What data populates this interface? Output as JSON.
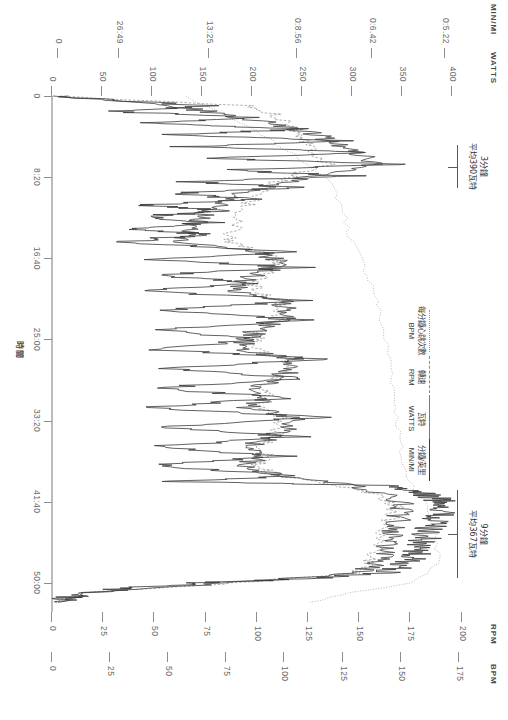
{
  "figure": {
    "title": "",
    "orientation": "rotated-90"
  },
  "axes": {
    "left_titles": [
      "MIN/MI",
      "WATTS"
    ],
    "right_titles": [
      "RPM",
      "BPM"
    ],
    "watts_ticks": [
      "400",
      "350",
      "300",
      "250",
      "200",
      "150",
      "100",
      "50",
      "0"
    ],
    "minmi_ticks": [
      "0:5.22",
      "0:6.42",
      "0:8.56",
      "13:25",
      "26:49",
      "0"
    ],
    "rpm_ticks": [
      "200",
      "175",
      "150",
      "125",
      "100",
      "75",
      "50",
      "25",
      "0"
    ],
    "bpm_ticks": [
      "175",
      "150",
      "125",
      "100",
      "75",
      "50",
      "25",
      "0"
    ],
    "time_ticks": [
      "0",
      "8:20",
      "16:40",
      "25:00",
      "33:20",
      "41:40",
      "50:00"
    ],
    "time_axis_label": "時間"
  },
  "legend": {
    "entries": [
      {
        "name": "bpm",
        "label_cjk": "每分鐘心跳次數",
        "label_unit": "BPM",
        "style": "dotted"
      },
      {
        "name": "rpm",
        "label_cjk": "轉速",
        "label_unit": "RPM",
        "style": "dashed"
      },
      {
        "name": "watts",
        "label_cjk": "瓦特",
        "label_unit": "WATTS",
        "style": "solid"
      },
      {
        "name": "minmi",
        "label_cjk": "分鐘/英里",
        "label_unit": "MIN/MI",
        "style": "solid-dark"
      }
    ]
  },
  "annotations": [
    {
      "name": "interval-3min",
      "line1": "3分鐘",
      "line2": "平均390瓦特"
    },
    {
      "name": "interval-9min",
      "line1": "9分鐘",
      "line2": "平均367瓦特"
    }
  ],
  "chart_data": {
    "type": "line",
    "title": "",
    "xlabel": "時間",
    "ylabel": "WATTS / MIN/MI / RPM / BPM",
    "x_ticks": [
      "0",
      "8:20",
      "16:40",
      "25:00",
      "33:20",
      "41:40",
      "50:00"
    ],
    "xlim": [
      0,
      53
    ],
    "axis_left_primary": {
      "name": "WATTS",
      "ticks": [
        400,
        350,
        300,
        250,
        200,
        150,
        100,
        50,
        0
      ],
      "ylim": [
        0,
        430
      ]
    },
    "axis_left_secondary": {
      "name": "MIN/MI",
      "ticks": [
        "0:5.22",
        "0:6.42",
        "0:8.56",
        "13:25",
        "26:49",
        "0"
      ]
    },
    "axis_right_primary": {
      "name": "RPM",
      "ticks": [
        200,
        175,
        150,
        125,
        100,
        75,
        50,
        25,
        0
      ],
      "ylim": [
        0,
        210
      ]
    },
    "axis_right_secondary": {
      "name": "BPM",
      "ticks": [
        175,
        150,
        125,
        100,
        75,
        50,
        25,
        0
      ],
      "ylim": [
        0,
        185
      ]
    },
    "grid": false,
    "legend_position": "center-right",
    "series": [
      {
        "name": "WATTS",
        "style": "solid",
        "color": "#3a3a3a",
        "points": [
          [
            0,
            5
          ],
          [
            1,
            150
          ],
          [
            1.6,
            60
          ],
          [
            2.2,
            210
          ],
          [
            2.8,
            90
          ],
          [
            3.4,
            260
          ],
          [
            4,
            110
          ],
          [
            4.6,
            300
          ],
          [
            5.2,
            130
          ],
          [
            5.8,
            330
          ],
          [
            6.4,
            150
          ],
          [
            7,
            350
          ],
          [
            7.6,
            170
          ],
          [
            8.2,
            300
          ],
          [
            8.8,
            140
          ],
          [
            9.4,
            250
          ],
          [
            10,
            120
          ],
          [
            10.6,
            200
          ],
          [
            11.2,
            95
          ],
          [
            11.8,
            175
          ],
          [
            12.4,
            85
          ],
          [
            13,
            160
          ],
          [
            13.6,
            80
          ],
          [
            14.2,
            150
          ],
          [
            15,
            70
          ],
          [
            16,
            240
          ],
          [
            16.8,
            95
          ],
          [
            17.6,
            250
          ],
          [
            18.4,
            100
          ],
          [
            19.2,
            200
          ],
          [
            20,
            90
          ],
          [
            21,
            260
          ],
          [
            22,
            110
          ],
          [
            23,
            255
          ],
          [
            24,
            105
          ],
          [
            25,
            215
          ],
          [
            26,
            95
          ],
          [
            27,
            270
          ],
          [
            28,
            120
          ],
          [
            29,
            250
          ],
          [
            30,
            100
          ],
          [
            31,
            235
          ],
          [
            32,
            95
          ],
          [
            33,
            265
          ],
          [
            34,
            115
          ],
          [
            35,
            245
          ],
          [
            36,
            100
          ],
          [
            37,
            230
          ],
          [
            38,
            95
          ],
          [
            39,
            250
          ],
          [
            39.6,
            120
          ],
          [
            40,
            330
          ],
          [
            40.6,
            360
          ],
          [
            41.2,
            380
          ],
          [
            41.8,
            395
          ],
          [
            42.6,
            390
          ],
          [
            43.4,
            385
          ],
          [
            44.2,
            380
          ],
          [
            45,
            375
          ],
          [
            45.8,
            370
          ],
          [
            46.6,
            365
          ],
          [
            47.4,
            360
          ],
          [
            48.2,
            350
          ],
          [
            49,
            330
          ],
          [
            49.6,
            250
          ],
          [
            50,
            150
          ],
          [
            50.6,
            70
          ],
          [
            51.4,
            20
          ],
          [
            52,
            5
          ]
        ]
      },
      {
        "name": "MIN/MI",
        "style": "solid-dark",
        "color": "#555555",
        "points": [
          [
            0,
            8
          ],
          [
            1,
            120
          ],
          [
            2,
            180
          ],
          [
            3,
            230
          ],
          [
            4,
            265
          ],
          [
            5,
            290
          ],
          [
            6,
            310
          ],
          [
            7,
            320
          ],
          [
            8,
            270
          ],
          [
            9,
            225
          ],
          [
            10,
            190
          ],
          [
            11,
            170
          ],
          [
            12,
            155
          ],
          [
            13,
            145
          ],
          [
            14,
            138
          ],
          [
            15,
            130
          ],
          [
            16,
            210
          ],
          [
            17,
            225
          ],
          [
            18,
            215
          ],
          [
            19,
            190
          ],
          [
            20,
            180
          ],
          [
            21,
            230
          ],
          [
            22,
            235
          ],
          [
            23,
            228
          ],
          [
            24,
            205
          ],
          [
            25,
            195
          ],
          [
            26,
            185
          ],
          [
            27,
            240
          ],
          [
            28,
            238
          ],
          [
            29,
            228
          ],
          [
            30,
            200
          ],
          [
            31,
            215
          ],
          [
            32,
            195
          ],
          [
            33,
            242
          ],
          [
            34,
            235
          ],
          [
            35,
            222
          ],
          [
            36,
            198
          ],
          [
            37,
            212
          ],
          [
            38,
            190
          ],
          [
            39,
            228
          ],
          [
            40,
            300
          ],
          [
            41,
            340
          ],
          [
            42,
            352
          ],
          [
            43,
            348
          ],
          [
            44,
            344
          ],
          [
            45,
            340
          ],
          [
            46,
            336
          ],
          [
            47,
            332
          ],
          [
            48,
            326
          ],
          [
            49,
            308
          ],
          [
            50,
            180
          ],
          [
            51,
            40
          ],
          [
            52,
            6
          ]
        ]
      },
      {
        "name": "RPM",
        "style": "dashed",
        "color": "#9a9a9a",
        "points": [
          [
            0,
            0
          ],
          [
            1,
            95
          ],
          [
            2,
            110
          ],
          [
            3,
            118
          ],
          [
            4,
            122
          ],
          [
            5,
            126
          ],
          [
            6,
            130
          ],
          [
            7,
            134
          ],
          [
            8,
            120
          ],
          [
            9,
            108
          ],
          [
            10,
            100
          ],
          [
            11,
            96
          ],
          [
            12,
            92
          ],
          [
            13,
            90
          ],
          [
            14,
            88
          ],
          [
            15,
            86
          ],
          [
            16,
            104
          ],
          [
            17,
            108
          ],
          [
            18,
            106
          ],
          [
            19,
            100
          ],
          [
            20,
            98
          ],
          [
            21,
            110
          ],
          [
            22,
            112
          ],
          [
            23,
            110
          ],
          [
            24,
            102
          ],
          [
            25,
            100
          ],
          [
            26,
            98
          ],
          [
            27,
            112
          ],
          [
            28,
            112
          ],
          [
            29,
            110
          ],
          [
            30,
            102
          ],
          [
            31,
            106
          ],
          [
            32,
            100
          ],
          [
            33,
            113
          ],
          [
            34,
            112
          ],
          [
            35,
            109
          ],
          [
            36,
            101
          ],
          [
            37,
            105
          ],
          [
            38,
            99
          ],
          [
            39,
            110
          ],
          [
            40,
            140
          ],
          [
            41,
            160
          ],
          [
            42,
            168
          ],
          [
            43,
            166
          ],
          [
            44,
            164
          ],
          [
            45,
            162
          ],
          [
            46,
            160
          ],
          [
            47,
            158
          ],
          [
            48,
            155
          ],
          [
            49,
            148
          ],
          [
            50,
            90
          ],
          [
            51,
            20
          ],
          [
            52,
            0
          ]
        ]
      },
      {
        "name": "BPM",
        "style": "dotted",
        "color": "#b0b0b0",
        "points": [
          [
            0,
            62
          ],
          [
            2,
            80
          ],
          [
            4,
            98
          ],
          [
            6,
            112
          ],
          [
            8,
            126
          ],
          [
            10,
            132
          ],
          [
            12,
            136
          ],
          [
            14,
            138
          ],
          [
            16,
            142
          ],
          [
            18,
            146
          ],
          [
            20,
            150
          ],
          [
            22,
            152
          ],
          [
            24,
            154
          ],
          [
            26,
            156
          ],
          [
            28,
            158
          ],
          [
            30,
            159
          ],
          [
            32,
            160
          ],
          [
            34,
            161
          ],
          [
            36,
            162
          ],
          [
            38,
            163
          ],
          [
            40,
            168
          ],
          [
            42,
            174
          ],
          [
            44,
            177
          ],
          [
            46,
            179
          ],
          [
            48,
            180
          ],
          [
            50,
            168
          ],
          [
            51,
            140
          ],
          [
            52,
            120
          ]
        ]
      }
    ],
    "annotations": [
      {
        "label": "3分鐘 平均390瓦特",
        "x_range": [
          5.0,
          9.5
        ],
        "note": "3 min, avg 390 watts"
      },
      {
        "label": "9分鐘 平均367瓦特",
        "x_range": [
          40.5,
          49.5
        ],
        "note": "9 min, avg 367 watts"
      }
    ]
  }
}
